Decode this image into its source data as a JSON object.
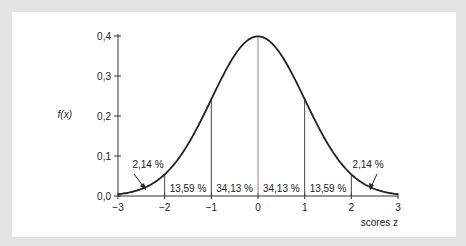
{
  "chart_data": {
    "type": "line",
    "title": "",
    "xlabel": "scores z",
    "ylabel": "f(x)",
    "x_ticks": [
      "−3",
      "−2",
      "−1",
      "0",
      "1",
      "2",
      "3"
    ],
    "y_ticks": [
      "0,0",
      "0,1",
      "0,2",
      "0,3",
      "0,4"
    ],
    "xlim": [
      -3,
      3
    ],
    "ylim": [
      0,
      0.4
    ],
    "grid": false,
    "series": [
      {
        "name": "standard normal density",
        "function": "f(x) = exp(-x^2/2)/sqrt(2*pi)"
      }
    ],
    "regions": [
      {
        "from": -3,
        "to": -2,
        "label": "2,14 %"
      },
      {
        "from": -2,
        "to": -1,
        "label": "13,59 %"
      },
      {
        "from": -1,
        "to": 0,
        "label": "34,13 %"
      },
      {
        "from": 0,
        "to": 1,
        "label": "34,13 %"
      },
      {
        "from": 1,
        "to": 2,
        "label": "13,59 %"
      },
      {
        "from": 2,
        "to": 3,
        "label": "2,14 %"
      }
    ]
  }
}
